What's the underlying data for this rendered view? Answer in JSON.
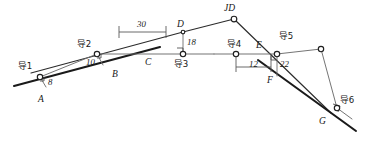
{
  "figure": {
    "type": "surveying-traverse-diagram",
    "width": 367,
    "height": 146,
    "background_color": "#ffffff",
    "line_color": "#1a1a1a",
    "traverse_color": "#6d6d6d"
  },
  "road_points": {
    "a": "A",
    "b": "B",
    "c": "C",
    "d": "D",
    "jd": "JD",
    "e": "E",
    "f": "F",
    "g": "G"
  },
  "stations": [
    {
      "id": "s1",
      "label": "导1"
    },
    {
      "id": "s2",
      "label": "导2"
    },
    {
      "id": "s3",
      "label": "导3"
    },
    {
      "id": "s4",
      "label": "导4"
    },
    {
      "id": "s5",
      "label": "导5"
    },
    {
      "id": "s6",
      "label": "导6"
    }
  ],
  "dimensions": [
    {
      "id": "d8",
      "value": "8",
      "kind": "offset"
    },
    {
      "id": "d10",
      "value": "10",
      "kind": "offset"
    },
    {
      "id": "d30",
      "value": "30",
      "kind": "span"
    },
    {
      "id": "d18",
      "value": "18",
      "kind": "offset"
    },
    {
      "id": "d12",
      "value": "12",
      "kind": "span"
    },
    {
      "id": "d22",
      "value": "22",
      "kind": "offset"
    }
  ]
}
